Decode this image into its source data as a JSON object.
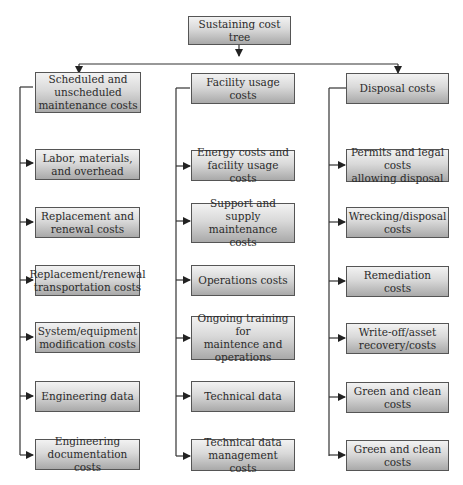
{
  "diagram": {
    "root": {
      "label": "Sustaining cost tree"
    },
    "branches": [
      {
        "label": "Scheduled and\nunscheduled\nmaintenance costs",
        "children": [
          "Labor, materials,\nand overhead",
          "Replacement and\nrenewal costs",
          "Replacement/renewal\ntransportation costs",
          "System/equipment\nmodification costs",
          "Engineering data",
          "Engineering\ndocumentation costs"
        ]
      },
      {
        "label": "Facility usage costs",
        "children": [
          "Energy costs and\nfacility usage costs",
          "Support and supply\nmaintenance costs",
          "Operations costs",
          "Ongoing training for\nmaintence and\noperations",
          "Technical data",
          "Technical data\nmanagement costs"
        ]
      },
      {
        "label": "Disposal costs",
        "children": [
          "Permits and legal costs\nallowing disposal",
          "Wrecking/disposal\ncosts",
          "Remediation costs",
          "Write-off/asset\nrecovery/costs",
          "Green and clean costs",
          "Green and clean costs"
        ]
      }
    ],
    "colors": {
      "box_border": "#555555",
      "box_gradient_top": "#f2f2f2",
      "box_gradient_bottom": "#a9a9a9",
      "line": "#333333",
      "text": "#2b2b2b"
    }
  }
}
